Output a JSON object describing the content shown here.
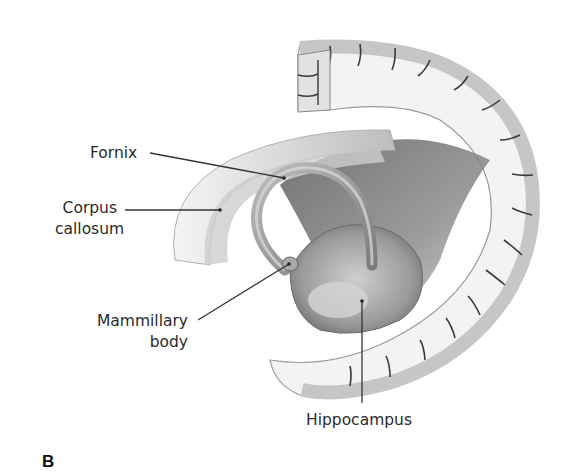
{
  "figure": {
    "panel_letter": "B",
    "labels": {
      "fornix": "Fornix",
      "corpus_callosum_line1": "Corpus",
      "corpus_callosum_line2": "callosum",
      "mammillary_line1": "Mammillary",
      "mammillary_line2": "body",
      "hippocampus": "Hippocampus"
    },
    "colors": {
      "text": "#2a2a2a",
      "leader_line": "#333333",
      "cortex_gray": "#c8c8c8",
      "white_matter": "#f2f2f2",
      "shadow": "#6e6e6e"
    }
  }
}
